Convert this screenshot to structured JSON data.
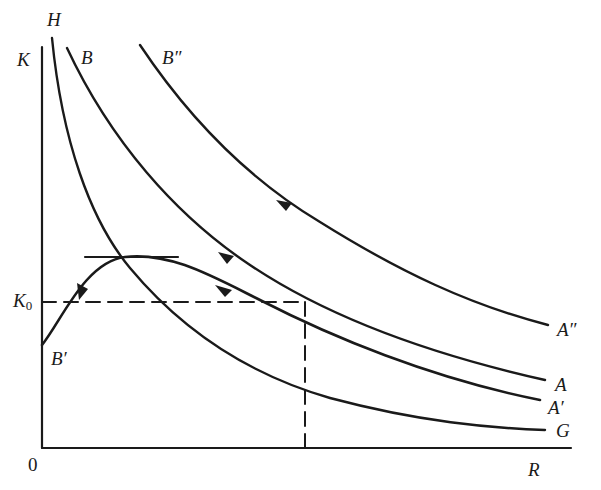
{
  "figure": {
    "type": "phase-diagram",
    "axes": {
      "y_label": "K",
      "x_label": "R",
      "origin_label": "0"
    },
    "reference": {
      "k0_label": "K",
      "k0_subscript": "0",
      "k0_line": "dashed horizontal at K0",
      "r0_line": "dashed vertical from K0 intersection on curve B–A to R axis"
    },
    "curves": [
      {
        "id": "H-G",
        "start_label": "H",
        "end_label": "G",
        "description": "downward-sloping locus, no arrow"
      },
      {
        "id": "B-A",
        "start_label": "B",
        "end_label": "A",
        "arrow": "pointing up-left (toward B)"
      },
      {
        "id": "B''-A''",
        "start_label": "B″",
        "end_label": "A″",
        "arrow": "pointing up-left (toward B″)"
      },
      {
        "id": "B'-A'",
        "start_label": "B′",
        "end_label": "A′",
        "arrow": "two arrows: up-left toward peak, then down-left toward B′",
        "peak": "tangent horizontal line at maximum, crossing H-G"
      }
    ],
    "labels": {
      "H": "H",
      "K": "K",
      "B": "B",
      "B2": "B″",
      "B1": "B′",
      "A2": "A″",
      "A": "A",
      "A1": "A′",
      "G": "G",
      "R": "R",
      "zero": "0"
    },
    "colors": {
      "ink": "#1a1a1a",
      "background": "#ffffff"
    }
  }
}
